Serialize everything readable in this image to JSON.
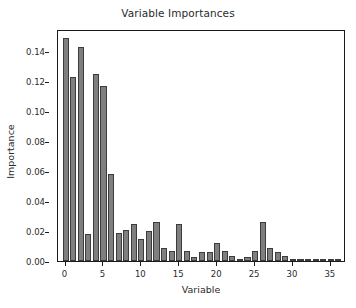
{
  "figure": {
    "background_color": "#ffffff",
    "bar_color": "#7f7f7f",
    "bar_edge_color": "#3c3c3c",
    "axis_color": "#1a1a1a",
    "text_color": "#2b2b2b"
  },
  "chart_data": {
    "type": "bar",
    "title": "Variable Importances",
    "xlabel": "Variable",
    "ylabel": "Importance",
    "grid": false,
    "legend": null,
    "xlim": [
      -1,
      37
    ],
    "ylim": [
      0.0,
      0.155
    ],
    "xticks": [
      0,
      5,
      10,
      15,
      20,
      25,
      30,
      35
    ],
    "xtick_labels": [
      "0",
      "5",
      "10",
      "15",
      "20",
      "25",
      "30",
      "35"
    ],
    "yticks": [
      0.0,
      0.02,
      0.04,
      0.06,
      0.08,
      0.1,
      0.12,
      0.14
    ],
    "ytick_labels": [
      "0.00",
      "0.02",
      "0.04",
      "0.06",
      "0.08",
      "0.10",
      "0.12",
      "0.14"
    ],
    "categories": [
      0,
      1,
      2,
      3,
      4,
      5,
      6,
      7,
      8,
      9,
      10,
      11,
      12,
      13,
      14,
      15,
      16,
      17,
      18,
      19,
      20,
      21,
      22,
      23,
      24,
      25,
      26,
      27,
      28,
      29,
      30,
      31,
      32,
      33,
      34,
      35,
      36
    ],
    "values": [
      0.149,
      0.123,
      0.143,
      0.018,
      0.125,
      0.117,
      0.058,
      0.0185,
      0.021,
      0.025,
      0.0145,
      0.02,
      0.026,
      0.0085,
      0.007,
      0.025,
      0.0065,
      0.003,
      0.006,
      0.006,
      0.012,
      0.007,
      0.0035,
      0.0015,
      0.003,
      0.007,
      0.026,
      0.0085,
      0.006,
      0.0035,
      0.001,
      0.0005,
      0.0003,
      0.001,
      0.0002,
      0.0002,
      0.0001
    ]
  }
}
